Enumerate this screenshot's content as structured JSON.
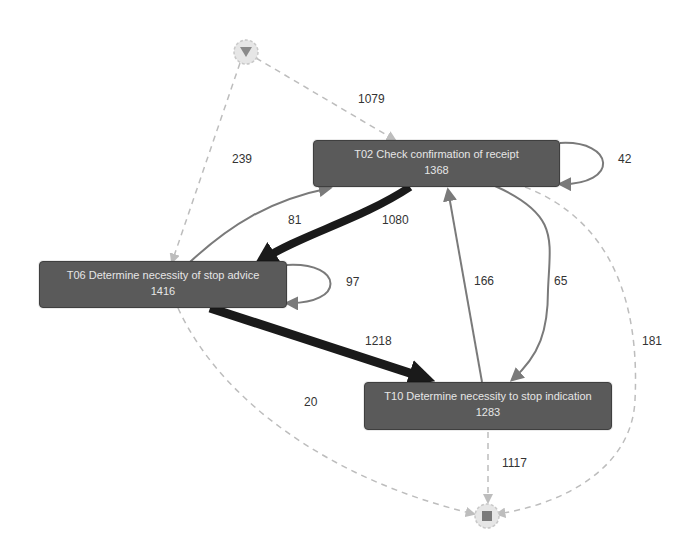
{
  "diagram": {
    "type": "process-map",
    "start_node": {
      "icon": "start-triangle-icon"
    },
    "end_node": {
      "icon": "end-square-icon"
    },
    "activities": [
      {
        "id": "T02",
        "label": "T02 Check confirmation of receipt",
        "count": "1368"
      },
      {
        "id": "T06",
        "label": "T06 Determine necessity of stop advice",
        "count": "1416"
      },
      {
        "id": "T10",
        "label": "T10 Determine necessity to stop indication",
        "count": "1283"
      }
    ],
    "edges": [
      {
        "from": "start",
        "to": "T02",
        "label": "1079",
        "style": "dashed"
      },
      {
        "from": "start",
        "to": "T06",
        "label": "239",
        "style": "dashed"
      },
      {
        "from": "T02",
        "to": "T02",
        "label": "42",
        "style": "solid"
      },
      {
        "from": "T02",
        "to": "T06",
        "label": "1080",
        "style": "solid-thick"
      },
      {
        "from": "T06",
        "to": "T02",
        "label": "81",
        "style": "solid"
      },
      {
        "from": "T06",
        "to": "T06",
        "label": "97",
        "style": "solid"
      },
      {
        "from": "T06",
        "to": "T10",
        "label": "1218",
        "style": "solid-thick"
      },
      {
        "from": "T10",
        "to": "T02",
        "label": "166",
        "style": "solid"
      },
      {
        "from": "T02",
        "to": "T10",
        "label": "65",
        "style": "solid"
      },
      {
        "from": "T02",
        "to": "end",
        "label": "181",
        "style": "dashed"
      },
      {
        "from": "T06",
        "to": "end",
        "label": "20",
        "style": "dashed"
      },
      {
        "from": "T10",
        "to": "end",
        "label": "1117",
        "style": "dashed"
      }
    ]
  },
  "colors": {
    "node_fill": "#5a5a5a",
    "node_text": "#e6e6e6",
    "edge_thin": "#7a7a7a",
    "edge_thick": "#1a1a1a",
    "edge_dashed": "#bdbdbd"
  }
}
